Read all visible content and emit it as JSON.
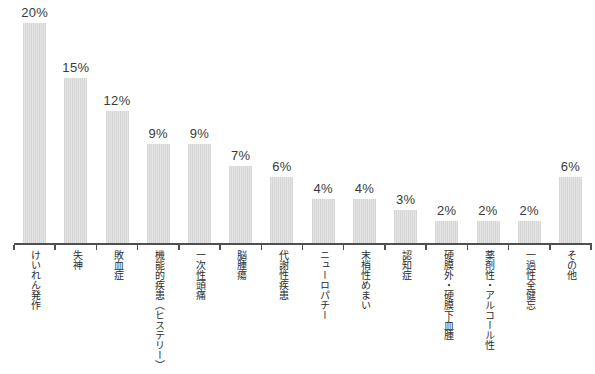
{
  "chart_data": {
    "type": "bar",
    "title": "",
    "xlabel": "",
    "ylabel": "",
    "unit": "%",
    "ylim": [
      0,
      22
    ],
    "grid": false,
    "legend": "none",
    "value_label_position": "above-bars",
    "category_label_orientation": "vertical",
    "bar_color": "#dcdcdc",
    "axis_color": "#4f4f4f",
    "text_color": "#3a3a3a",
    "categories": [
      "けいれん発作",
      "失神",
      "敗血症",
      "機能的疾患（ヒステリー）",
      "一次性頭痛",
      "脳腫瘍",
      "代謝性疾患",
      "ニューロパチー",
      "末梢性めまい",
      "認知症",
      "硬膜外・硬膜下血腫",
      "薬剤性・アルコール性",
      "一過性全健忘",
      "その他"
    ],
    "values": [
      20,
      15,
      12,
      9,
      9,
      7,
      6,
      4,
      4,
      3,
      2,
      2,
      2,
      6
    ],
    "value_labels": [
      "20%",
      "15%",
      "12%",
      "9%",
      "9%",
      "7%",
      "6%",
      "4%",
      "4%",
      "3%",
      "2%",
      "2%",
      "2%",
      "6%"
    ]
  }
}
